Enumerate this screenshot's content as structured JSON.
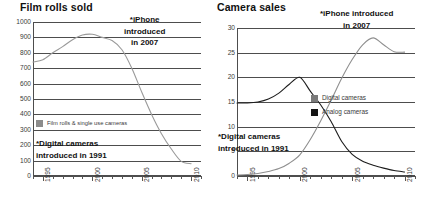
{
  "charts": [
    {
      "id": "film-rolls-sold",
      "title": "Film rolls sold",
      "annotations": [
        {
          "id": "iphone",
          "lines": [
            "*iPhone",
            "introduced",
            "in 2007"
          ]
        },
        {
          "id": "digital",
          "lines": [
            "*Digital cameras",
            "introduced in 1991"
          ]
        }
      ],
      "legend": [
        {
          "label": "Film rolls & single use cameras",
          "color": "#8c8c8c"
        }
      ]
    },
    {
      "id": "camera-sales",
      "title": "Camera sales",
      "annotations": [
        {
          "id": "iphone",
          "lines": [
            "*iPhone introduced",
            "in 2007"
          ]
        },
        {
          "id": "digital",
          "lines": [
            "*Digital cameras",
            "introduced in 1991"
          ]
        }
      ],
      "legend": [
        {
          "label": "Digital cameras",
          "color": "#7a7a7a"
        },
        {
          "label": "Analog cameras",
          "color": "#141414"
        }
      ]
    }
  ],
  "chart_data": [
    {
      "type": "line",
      "title": "Film rolls sold",
      "xlabel": "",
      "ylabel": "",
      "xlim": [
        1994,
        2011
      ],
      "ylim": [
        0,
        1000
      ],
      "yticks": [
        0,
        100,
        200,
        300,
        400,
        500,
        600,
        700,
        800,
        900,
        1000
      ],
      "xticks": [
        1995,
        2000,
        2005,
        2010
      ],
      "xtick_labels": [
        "1995",
        "2000",
        "2005",
        "2010"
      ],
      "grid": true,
      "legend_position": "inside-left",
      "series": [
        {
          "name": "Film rolls & single use cameras",
          "color": "#9a9a9a",
          "x": [
            1994,
            1995,
            1996,
            1997,
            1998,
            1999,
            2000,
            2001,
            2002,
            2003,
            2004,
            2005,
            2006,
            2007,
            2008,
            2009,
            2010
          ],
          "values": [
            740,
            755,
            800,
            840,
            885,
            915,
            920,
            900,
            880,
            820,
            700,
            545,
            400,
            275,
            175,
            95,
            80
          ]
        }
      ],
      "annotations": [
        {
          "text": "*iPhone introduced in 2007",
          "x": 2007
        },
        {
          "text": "*Digital cameras introduced in 1991",
          "x": 1991
        }
      ]
    },
    {
      "type": "line",
      "title": "Camera sales",
      "xlabel": "",
      "ylabel": "",
      "xlim": [
        1994,
        2011
      ],
      "ylim": [
        0,
        30
      ],
      "yticks": [
        0,
        5,
        10,
        15,
        20,
        25,
        30
      ],
      "xticks": [
        1995,
        2000,
        2005,
        2010
      ],
      "xtick_labels": [
        "1995",
        "2000",
        "2005",
        "2010"
      ],
      "grid": true,
      "legend_position": "inside-right",
      "series": [
        {
          "name": "Analog cameras",
          "color": "#1d1d1d",
          "x": [
            1994,
            1995,
            1996,
            1997,
            1998,
            1999,
            2000,
            2001,
            2002,
            2003,
            2004,
            2005,
            2006,
            2007,
            2008,
            2009,
            2010
          ],
          "values": [
            14.8,
            14.8,
            15.0,
            15.6,
            16.8,
            18.6,
            20.0,
            17.2,
            14.4,
            11.0,
            7.0,
            4.4,
            3.0,
            2.2,
            1.6,
            1.1,
            0.8
          ]
        },
        {
          "name": "Digital cameras",
          "color": "#8f8f8f",
          "x": [
            1994,
            1995,
            1996,
            1997,
            1998,
            1999,
            2000,
            2001,
            2002,
            2003,
            2004,
            2005,
            2006,
            2007,
            2008,
            2009,
            2010
          ],
          "values": [
            0.2,
            0.3,
            0.5,
            0.9,
            1.5,
            2.6,
            4.3,
            7.4,
            11.2,
            15.4,
            19.8,
            23.6,
            26.6,
            28.0,
            26.6,
            25.2,
            25.1
          ]
        }
      ],
      "annotations": [
        {
          "text": "*iPhone introduced in 2007",
          "x": 2007
        },
        {
          "text": "*Digital cameras introduced in 1991",
          "x": 1991
        }
      ]
    }
  ]
}
